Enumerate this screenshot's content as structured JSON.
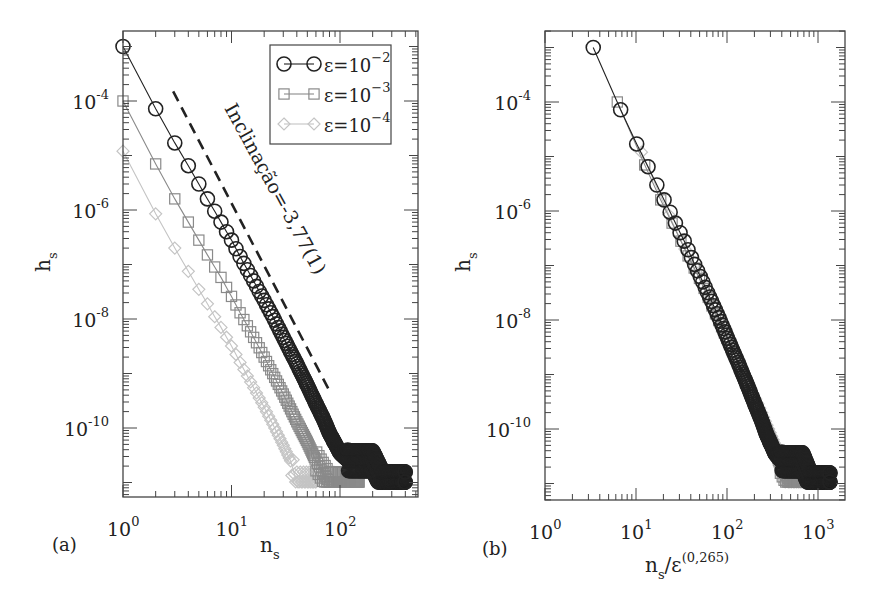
{
  "figure": {
    "panels": [
      {
        "id": "a",
        "panel_label": "(a)",
        "xlabel": "n",
        "xlabel_sub": "s",
        "ylabel": "h",
        "ylabel_sub": "s",
        "xticks": [
          {
            "base": "10",
            "exp": "0"
          },
          {
            "base": "10",
            "exp": "1"
          },
          {
            "base": "10",
            "exp": "2"
          }
        ],
        "yticks": [
          {
            "base": "10",
            "exp": "-4"
          },
          {
            "base": "10",
            "exp": "-6"
          },
          {
            "base": "10",
            "exp": "-8"
          },
          {
            "base": "10",
            "exp": "-10"
          }
        ],
        "annotation": "Inclinação=-3,77(1)",
        "legend": [
          {
            "label": "ε=10",
            "exp": "−2",
            "marker": "circle",
            "color": "#222222"
          },
          {
            "label": "ε=10",
            "exp": "−3",
            "marker": "square",
            "color": "#8a8a8a"
          },
          {
            "label": "ε=10",
            "exp": "−4",
            "marker": "diamond",
            "color": "#c4c4c4"
          }
        ]
      },
      {
        "id": "b",
        "panel_label": "(b)",
        "xlabel": "n",
        "xlabel_sub": "s",
        "xlabel_suffix": "/ε",
        "xlabel_sup": "(0,265)",
        "ylabel": "h",
        "ylabel_sub": "s",
        "xticks": [
          {
            "base": "10",
            "exp": "0"
          },
          {
            "base": "10",
            "exp": "1"
          },
          {
            "base": "10",
            "exp": "2"
          },
          {
            "base": "10",
            "exp": "3"
          }
        ],
        "yticks": [
          {
            "base": "10",
            "exp": "-4"
          },
          {
            "base": "10",
            "exp": "-6"
          },
          {
            "base": "10",
            "exp": "-8"
          },
          {
            "base": "10",
            "exp": "-10"
          }
        ]
      }
    ]
  },
  "chart_data": [
    {
      "type": "scatter",
      "title": "(a)",
      "xlabel": "n_s",
      "ylabel": "h_s",
      "xscale": "log",
      "yscale": "log",
      "xlim": [
        1,
        525
      ],
      "ylim": [
        5e-12,
        0.002
      ],
      "grid": false,
      "legend_position": "upper right",
      "annotation": {
        "text": "Inclinação=-3,77(1)",
        "type": "dashed reference line",
        "slope": -3.77,
        "from": [
          2.9,
          0.00015
        ],
        "to": [
          80,
          4.8e-10
        ]
      },
      "series": [
        {
          "name": "ε=10^-2",
          "marker": "circle",
          "line": "solid",
          "color": "#222222",
          "x": [
            1,
            2,
            3,
            4,
            5,
            6,
            7,
            8,
            9,
            10,
            12,
            14,
            16,
            18,
            20,
            25,
            30,
            35,
            40,
            50,
            60,
            70,
            80,
            100,
            120,
            150,
            200,
            250,
            300,
            400
          ],
          "y": [
            0.001,
            7.2e-05,
            1.7e-05,
            6.5e-06,
            3e-06,
            1.6e-06,
            9.5e-07,
            6e-07,
            4e-07,
            2.8e-07,
            1.4e-07,
            8e-08,
            5e-08,
            3.2e-08,
            2.2e-08,
            9.5e-09,
            4.6e-09,
            2.5e-09,
            1.5e-09,
            6e-10,
            2.8e-10,
            1.5e-10,
            8e-11,
            3.5e-11,
            2.5e-11,
            2.5e-11,
            2.5e-11,
            1e-11,
            1e-11,
            1e-11
          ]
        },
        {
          "name": "ε=10^-3",
          "marker": "square",
          "line": "solid",
          "color": "#8a8a8a",
          "x": [
            1,
            2,
            3,
            4,
            5,
            6,
            7,
            8,
            10,
            12,
            14,
            16,
            20,
            25,
            30,
            40,
            50,
            60,
            80,
            100,
            150
          ],
          "y": [
            0.0001,
            7e-06,
            1.6e-06,
            6e-07,
            2.8e-07,
            1.5e-07,
            9e-08,
            5.8e-08,
            2.6e-08,
            1.3e-08,
            7.5e-09,
            4.6e-09,
            2e-09,
            8.5e-10,
            4.2e-10,
            1.3e-10,
            5.5e-11,
            2.5e-11,
            1e-11,
            1e-11,
            1e-11
          ]
        },
        {
          "name": "ε=10^-4",
          "marker": "diamond",
          "line": "solid",
          "color": "#c4c4c4",
          "x": [
            1,
            2,
            3,
            4,
            5,
            6,
            7,
            8,
            10,
            12,
            14,
            16,
            20,
            25,
            30,
            35,
            40,
            50,
            60
          ],
          "y": [
            1.2e-05,
            8.5e-07,
            2e-07,
            7.5e-08,
            3.5e-08,
            1.9e-08,
            1.1e-08,
            7e-09,
            3.2e-09,
            1.6e-09,
            9e-10,
            5.5e-10,
            2.4e-10,
            1e-10,
            4.8e-11,
            2.5e-11,
            1e-11,
            1e-11,
            1e-11
          ]
        }
      ]
    },
    {
      "type": "scatter",
      "title": "(b)",
      "xlabel": "n_s/ε^(0,265)",
      "ylabel": "h_s",
      "xscale": "log",
      "yscale": "log",
      "xlim": [
        1,
        2000
      ],
      "ylim": [
        5e-12,
        0.002
      ],
      "grid": false,
      "series": [
        {
          "name": "ε=10^-2",
          "marker": "circle",
          "color": "#222222",
          "x_scale_factor": 3.39
        },
        {
          "name": "ε=10^-3",
          "marker": "square",
          "color": "#8a8a8a",
          "x_scale_factor": 6.23
        },
        {
          "name": "ε=10^-4",
          "marker": "diamond",
          "color": "#c4c4c4",
          "x_scale_factor": 11.48
        }
      ],
      "note": "Data collapse: same series as (a) with x rescaled by ε^(-0.265)"
    }
  ]
}
